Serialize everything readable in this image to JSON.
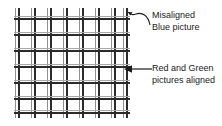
{
  "diagram": {
    "background_color": "#ffffff"
  },
  "grid": {
    "name": "crosshatch-test-pattern",
    "vertical_line_count": 8,
    "horizontal_line_count": 7,
    "vertical_positions": [
      4,
      20,
      36,
      52,
      68,
      84,
      100,
      112
    ],
    "horizontal_positions": [
      10,
      26,
      42,
      58,
      74,
      90,
      104
    ],
    "misalignment_offset_px": 3,
    "aligned_color": "#2b2b2b",
    "misaligned_color": "#8f8f8f"
  },
  "callouts": [
    {
      "name": "misaligned-blue",
      "line1": "Misaligned",
      "line2": "Blue picture",
      "leader": "curved-arrow-icon"
    },
    {
      "name": "aligned-red-green",
      "line1": "Red and Green",
      "line2": "pictures aligned",
      "leader": "left-arrow-icon"
    }
  ]
}
